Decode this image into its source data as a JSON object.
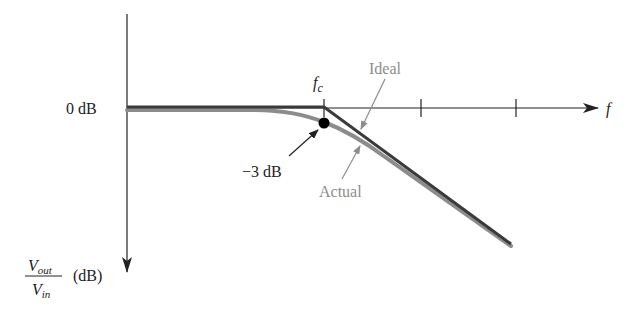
{
  "diagram": {
    "labels": {
      "zero_db": "0 dB",
      "minus3_db": "−3 dB",
      "fc": "f",
      "fc_sub": "c",
      "f_axis": "f",
      "ideal": "Ideal",
      "actual": "Actual",
      "y_num": "V",
      "y_num_sub": "out",
      "y_den": "V",
      "y_den_sub": "in",
      "y_unit": "(dB)"
    },
    "colors": {
      "axis": "#222222",
      "ideal": "#3a3a3a",
      "actual": "#8c8c8c",
      "annotation_gray": "#8c8c8c",
      "point": "#000000"
    },
    "curves": [
      {
        "name": "Ideal",
        "description": "flat at 0 dB until fc, then straight line rolloff"
      },
      {
        "name": "Actual",
        "description": "smooth curve, -3 dB at fc, asymptotically approaches ideal rolloff"
      }
    ],
    "markers": [
      {
        "name": "-3 dB point",
        "at": "fc"
      }
    ],
    "x_axis_ticks": 3
  }
}
